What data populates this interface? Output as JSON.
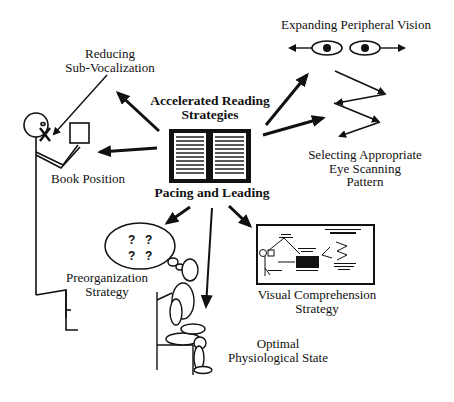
{
  "diagram": {
    "central": {
      "title_line1": "Accelerated Reading",
      "title_line2": "Strategies",
      "subtitle": "Pacing and Leading",
      "icon": "open-book-icon"
    },
    "nodes": {
      "sub_vocalization": {
        "line1": "Reducing",
        "line2": "Sub-Vocalization",
        "icon": "stick-figure-mouth-x-icon"
      },
      "book_position": {
        "line1": "Book Position",
        "icon": "stick-figure-holding-book-icon"
      },
      "peripheral_vision": {
        "line1": "Expanding Peripheral Vision",
        "icon": "eyes-outward-arrows-icon"
      },
      "eye_scanning": {
        "line1": "Selecting Appropriate",
        "line2": "Eye Scanning",
        "line3": "Pattern",
        "icon": "zigzag-arrows-icon"
      },
      "preorganization": {
        "line1": "Preorganization",
        "line2": "Strategy",
        "icon": "thought-bubble-icon",
        "bubble_marks": [
          "?",
          "?",
          "?",
          "?"
        ]
      },
      "physiological": {
        "line1": "Optimal",
        "line2": "Physiological State",
        "icon": "seated-mannequin-icon"
      },
      "visual_comprehension": {
        "line1": "Visual Comprehension",
        "line2": "Strategy",
        "icon": "diagram-thumbnail-icon"
      }
    },
    "colors": {
      "ink": "#111111",
      "background": "#ffffff"
    }
  }
}
